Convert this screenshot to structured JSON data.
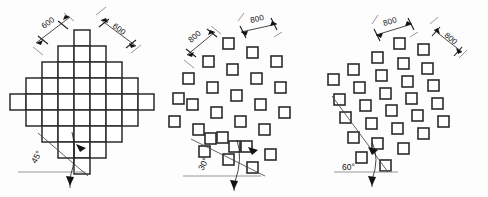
{
  "drawing": {
    "title": "Square pile lattice arrangements",
    "background_color": "#fdfdfd",
    "line_color": "#2b2b2b"
  },
  "figures": [
    {
      "id": "fig-1",
      "name": "contiguous-grid-45",
      "angle_label": "45°",
      "angle_value": 45,
      "dim_left": "600",
      "dim_right": "600",
      "pattern": "contiguous-diamond-grid",
      "cell_count": 61,
      "cell_size_px": 16
    },
    {
      "id": "fig-2",
      "name": "separated-lattice-30",
      "angle_label": "30°",
      "angle_value": 30,
      "dim_left": "800",
      "dim_right": "800",
      "pattern": "separated-rhombic-lattice",
      "tile_count": 27,
      "tile_size_px": 11
    },
    {
      "id": "fig-3",
      "name": "separated-lattice-60",
      "angle_label": "60°",
      "angle_value": 60,
      "dim_left": "800",
      "dim_right": "800",
      "pattern": "separated-rhombic-lattice",
      "tile_count": 28,
      "tile_size_px": 11
    }
  ]
}
